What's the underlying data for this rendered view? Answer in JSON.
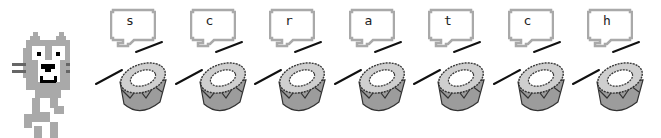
{
  "sprite": {
    "name": "cat"
  },
  "letters": [
    "s",
    "c",
    "r",
    "a",
    "t",
    "c",
    "h"
  ],
  "colors": {
    "gray": "#a9a9a9",
    "dark": "#222222",
    "drum_top": "#cfcfcf",
    "drum_side": "#9c9c9c"
  }
}
